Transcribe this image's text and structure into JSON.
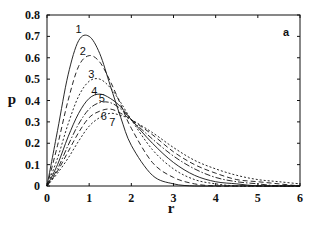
{
  "chart_data": {
    "type": "line",
    "title": "",
    "panel_label": "a",
    "xlabel": "r",
    "ylabel": "p",
    "xlim": [
      0,
      6
    ],
    "ylim": [
      0,
      0.8
    ],
    "xticks": [
      0,
      1,
      2,
      3,
      4,
      5,
      6
    ],
    "xtick_labels": [
      "0",
      "1",
      "2",
      "3",
      "4",
      "5",
      "6"
    ],
    "yticks": [
      0,
      0.1,
      0.2,
      0.3,
      0.4,
      0.5,
      0.6,
      0.7,
      0.8
    ],
    "ytick_labels": [
      "0",
      "0.1",
      "0.2",
      "0.3",
      "0.4",
      "0.5",
      "0.6",
      "0.7",
      "0.8"
    ],
    "grid": false,
    "legend": "inline curve labels",
    "x": [
      0,
      0.25,
      0.5,
      0.75,
      1.0,
      1.25,
      1.5,
      1.75,
      2.0,
      2.5,
      3.0,
      3.5,
      4.0,
      4.5,
      5.0,
      5.5,
      6.0
    ],
    "series": [
      {
        "name": "1",
        "style": "solid",
        "peak": {
          "r": 0.9,
          "p": 0.71
        },
        "values": [
          0,
          0.26,
          0.52,
          0.68,
          0.7,
          0.62,
          0.47,
          0.32,
          0.19,
          0.05,
          0.01,
          0.0,
          0.0,
          0.0,
          0.0,
          0.0,
          0.0
        ]
      },
      {
        "name": "2",
        "style": "dashed",
        "peak": {
          "r": 1.0,
          "p": 0.61
        },
        "values": [
          0,
          0.19,
          0.4,
          0.56,
          0.61,
          0.58,
          0.49,
          0.38,
          0.27,
          0.11,
          0.04,
          0.01,
          0.0,
          0.0,
          0.0,
          0.0,
          0.0
        ]
      },
      {
        "name": "3",
        "style": "dotted",
        "peak": {
          "r": 1.2,
          "p": 0.5
        },
        "values": [
          0,
          0.13,
          0.29,
          0.42,
          0.49,
          0.5,
          0.46,
          0.39,
          0.31,
          0.17,
          0.08,
          0.03,
          0.01,
          0.0,
          0.0,
          0.0,
          0.0
        ]
      },
      {
        "name": "4",
        "style": "solid",
        "peak": {
          "r": 1.3,
          "p": 0.43
        },
        "values": [
          0,
          0.1,
          0.23,
          0.34,
          0.41,
          0.43,
          0.41,
          0.37,
          0.31,
          0.2,
          0.11,
          0.05,
          0.02,
          0.01,
          0.0,
          0.0,
          0.0
        ]
      },
      {
        "name": "5",
        "style": "dash-dot",
        "peak": {
          "r": 1.4,
          "p": 0.39
        },
        "values": [
          0,
          0.08,
          0.19,
          0.29,
          0.36,
          0.39,
          0.39,
          0.36,
          0.31,
          0.22,
          0.14,
          0.08,
          0.04,
          0.02,
          0.01,
          0.0,
          0.0
        ]
      },
      {
        "name": "6",
        "style": "dashed",
        "peak": {
          "r": 1.5,
          "p": 0.36
        },
        "values": [
          0,
          0.07,
          0.16,
          0.25,
          0.32,
          0.35,
          0.36,
          0.34,
          0.31,
          0.24,
          0.16,
          0.1,
          0.06,
          0.03,
          0.02,
          0.01,
          0.0
        ]
      },
      {
        "name": "7",
        "style": "dotted",
        "peak": {
          "r": 1.6,
          "p": 0.34
        },
        "values": [
          0,
          0.06,
          0.13,
          0.21,
          0.28,
          0.32,
          0.34,
          0.33,
          0.31,
          0.25,
          0.18,
          0.12,
          0.08,
          0.05,
          0.03,
          0.02,
          0.01
        ]
      }
    ],
    "curve_label_positions": [
      {
        "name": "1",
        "r": 0.75,
        "p": 0.715
      },
      {
        "name": "2",
        "r": 0.85,
        "p": 0.615
      },
      {
        "name": "3",
        "r": 1.05,
        "p": 0.505
      },
      {
        "name": "4",
        "r": 1.12,
        "p": 0.425
      },
      {
        "name": "5",
        "r": 1.3,
        "p": 0.395
      },
      {
        "name": "6",
        "r": 1.35,
        "p": 0.31
      },
      {
        "name": "7",
        "r": 1.55,
        "p": 0.28
      }
    ]
  },
  "colors": {
    "ink": "#111111",
    "background": "#ffffff"
  }
}
